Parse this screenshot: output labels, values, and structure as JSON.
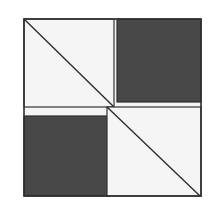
{
  "diagram": {
    "type": "quilt-block",
    "colors": {
      "background": "#ffffff",
      "light": "#f4f4f4",
      "dark": "#484848",
      "stroke": "#2e2e2e"
    },
    "quadrants": [
      {
        "position": "top-left",
        "fill": "light",
        "diagonal": true
      },
      {
        "position": "top-right",
        "fill": "dark",
        "diagonal": false
      },
      {
        "position": "bottom-left",
        "fill": "dark",
        "diagonal": false
      },
      {
        "position": "bottom-right",
        "fill": "light",
        "diagonal": true
      }
    ]
  }
}
